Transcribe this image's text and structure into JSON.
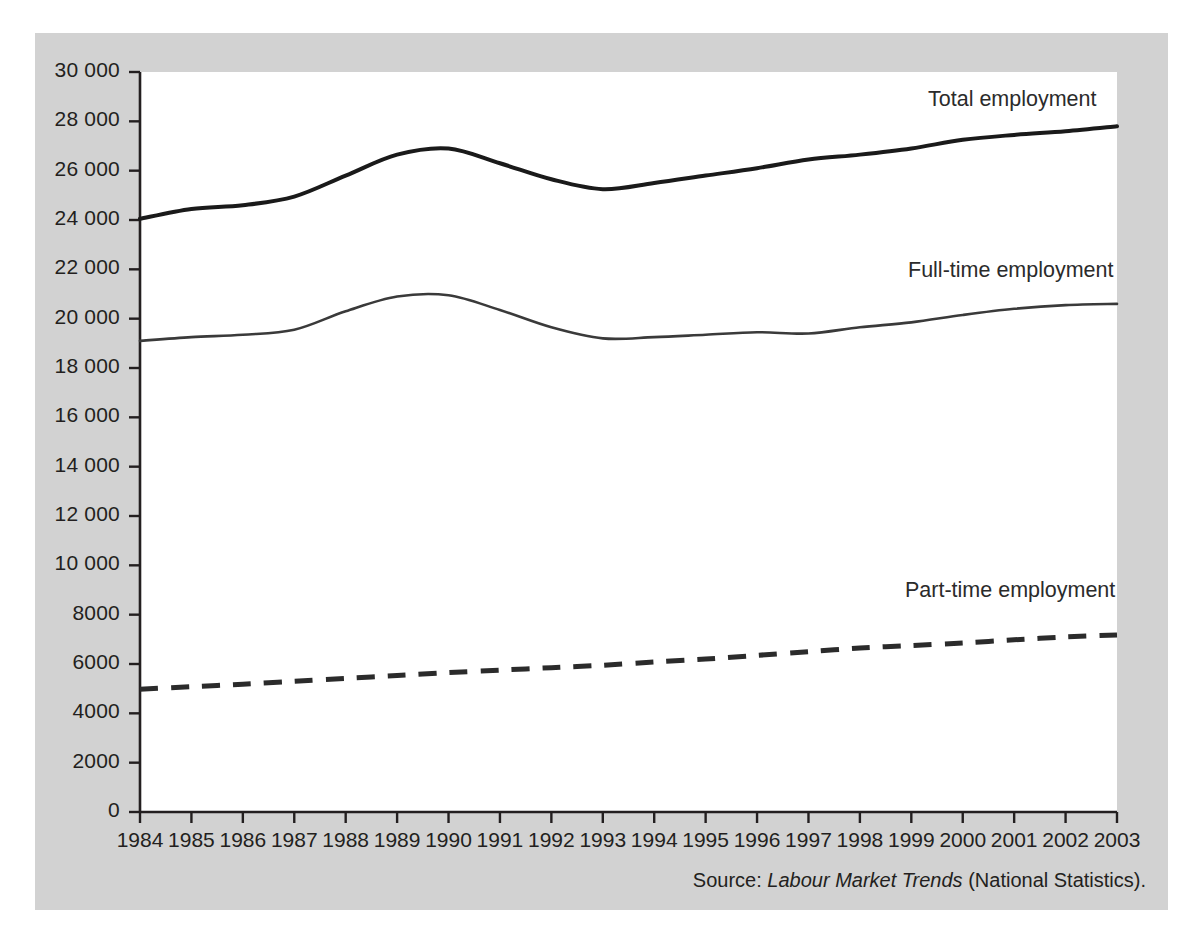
{
  "figure": {
    "panel_background": "#d2d2d2",
    "plot_background": "#ffffff",
    "source_prefix": "Source:",
    "source_title": "Labour Market Trends",
    "source_suffix": "(National Statistics)."
  },
  "chart_data": {
    "type": "line",
    "title": "",
    "subtitle": "",
    "xlabel": "",
    "ylabel": "",
    "xlim": [
      1984,
      2003
    ],
    "ylim": [
      0,
      30000
    ],
    "grid": false,
    "legend_position": "inline-right",
    "axis_thousands_separator": "space",
    "categories": [
      1984,
      1985,
      1986,
      1987,
      1988,
      1989,
      1990,
      1991,
      1992,
      1993,
      1994,
      1995,
      1996,
      1997,
      1998,
      1999,
      2000,
      2001,
      2002,
      2003
    ],
    "x": [
      "1984",
      "1985",
      "1986",
      "1987",
      "1988",
      "1989",
      "1990",
      "1991",
      "1992",
      "1993",
      "1994",
      "1995",
      "1996",
      "1997",
      "1998",
      "1999",
      "2000",
      "2001",
      "2002",
      "2003"
    ],
    "yticks": [
      0,
      2000,
      4000,
      6000,
      8000,
      10000,
      12000,
      14000,
      16000,
      18000,
      20000,
      22000,
      24000,
      26000,
      28000,
      30000
    ],
    "ytick_labels": [
      "0",
      "2000",
      "4000",
      "6000",
      "8000",
      "10 000",
      "12 000",
      "14 000",
      "16 000",
      "18 000",
      "20 000",
      "22 000",
      "24 000",
      "26 000",
      "28 000",
      "30 000"
    ],
    "series": [
      {
        "name": "Total employment",
        "style": "solid",
        "color": "#1a1a1a",
        "width": 4,
        "values": [
          24050,
          24450,
          24600,
          24950,
          25800,
          26650,
          26900,
          26300,
          25650,
          25250,
          25500,
          25800,
          26100,
          26450,
          26650,
          26900,
          27250,
          27450,
          27600,
          27800
        ]
      },
      {
        "name": "Full-time employment",
        "style": "solid",
        "color": "#3a3a3a",
        "width": 2.6,
        "values": [
          19100,
          19250,
          19350,
          19550,
          20300,
          20900,
          20950,
          20350,
          19650,
          19200,
          19250,
          19350,
          19450,
          19400,
          19650,
          19850,
          20150,
          20400,
          20550,
          20600
        ]
      },
      {
        "name": "Part-time employment",
        "style": "dashed",
        "color": "#2b2b2b",
        "width": 5,
        "values": [
          4980,
          5080,
          5180,
          5300,
          5420,
          5530,
          5650,
          5750,
          5850,
          5950,
          6080,
          6200,
          6350,
          6500,
          6650,
          6750,
          6850,
          6980,
          7100,
          7180
        ]
      }
    ]
  }
}
